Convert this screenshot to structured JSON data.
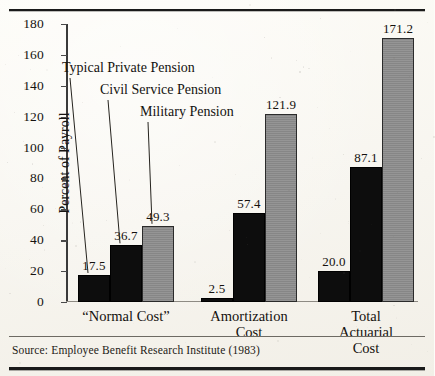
{
  "figure": {
    "source_note": "Source: Employee Benefit Research Institute (1983)"
  },
  "chart_data": {
    "type": "bar",
    "title": "",
    "xlabel": "",
    "ylabel": "Percent of Payroll",
    "ylim": [
      0,
      180
    ],
    "ytick_step": 20,
    "yticks": [
      "180",
      "160",
      "140",
      "120",
      "100",
      "80",
      "60",
      "40",
      "20",
      "0"
    ],
    "grid": false,
    "legend_position": "leader-lines",
    "categories": [
      "“Normal Cost”",
      "Amortization Cost",
      "Total Actuarial Cost"
    ],
    "category_lines": [
      [
        "“Normal Cost”"
      ],
      [
        "Amortization",
        "Cost"
      ],
      [
        "Total",
        "Actuarial Cost"
      ]
    ],
    "series": [
      {
        "name": "Typical Private Pension",
        "color": "#0d0d0d",
        "values": [
          17.5,
          36.7,
          49.3
        ]
      },
      {
        "name": "Civil Service Pension",
        "color": "#0d0d0d",
        "values": [
          2.5,
          57.4,
          121.9
        ]
      },
      {
        "name": "Military Pension",
        "color": "#8d8d8d",
        "values": [
          20.0,
          87.1,
          171.2
        ]
      }
    ],
    "bars": [
      {
        "group": 0,
        "series": 0,
        "value": 17.5,
        "label": "17.5",
        "style": "dark"
      },
      {
        "group": 0,
        "series": 1,
        "value": 36.7,
        "label": "36.7",
        "style": "dark"
      },
      {
        "group": 0,
        "series": 2,
        "value": 49.3,
        "label": "49.3",
        "style": "gray"
      },
      {
        "group": 1,
        "series": 0,
        "value": 2.5,
        "label": "2.5",
        "style": "dark"
      },
      {
        "group": 1,
        "series": 1,
        "value": 57.4,
        "label": "57.4",
        "style": "dark"
      },
      {
        "group": 1,
        "series": 2,
        "value": 121.9,
        "label": "121.9",
        "style": "gray"
      },
      {
        "group": 2,
        "series": 0,
        "value": 20.0,
        "label": "20.0",
        "style": "dark"
      },
      {
        "group": 2,
        "series": 1,
        "value": 87.1,
        "label": "87.1",
        "style": "dark"
      },
      {
        "group": 2,
        "series": 2,
        "value": 171.2,
        "label": "171.2",
        "style": "gray"
      }
    ],
    "annotations": [
      {
        "text": "Typical Private Pension",
        "x": 62,
        "y": 60,
        "points_to_group": 0,
        "points_to_series": 0
      },
      {
        "text": "Civil Service Pension",
        "x": 100,
        "y": 82,
        "points_to_group": 0,
        "points_to_series": 1
      },
      {
        "text": "Military Pension",
        "x": 140,
        "y": 104,
        "points_to_group": 0,
        "points_to_series": 2
      }
    ]
  }
}
